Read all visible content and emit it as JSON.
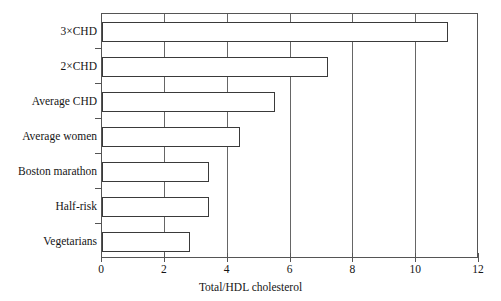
{
  "chart_data": {
    "type": "bar",
    "orientation": "horizontal",
    "title": "",
    "xlabel": "Total/HDL cholesterol",
    "ylabel": "",
    "xlim": [
      0,
      12
    ],
    "ylim": null,
    "xticks": [
      0,
      2,
      4,
      6,
      8,
      10,
      12
    ],
    "xticklabels": [
      "0",
      "2",
      "4",
      "6",
      "8",
      "10",
      "12"
    ],
    "grid": "vertical",
    "legend": null,
    "categories": [
      "3×CHD",
      "2×CHD",
      "Average CHD",
      "Average women",
      "Boston marathon",
      "Half-risk",
      "Vegetarians"
    ],
    "values": [
      11.0,
      7.2,
      5.5,
      4.4,
      3.4,
      3.4,
      2.8
    ],
    "bar_facecolor": "#ffffff",
    "bar_edgecolor": "#3a3a3a",
    "axis_color": "#555555"
  }
}
